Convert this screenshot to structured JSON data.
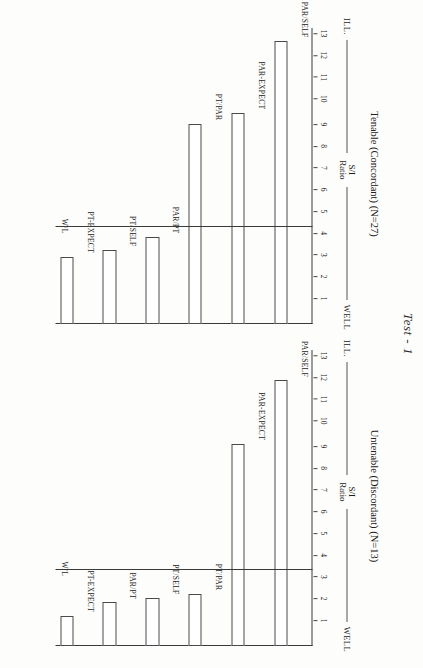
{
  "page": {
    "test_title": "Test - 1"
  },
  "axis": {
    "high_label": "WELL",
    "low_label": "ILL.",
    "name_line1": "S/I",
    "name_line2": "Ratio",
    "ticks": [
      1,
      2,
      3,
      4,
      5,
      6,
      7,
      8,
      9,
      10,
      11,
      12,
      13
    ],
    "wl_label": "W/L"
  },
  "chart_data": [
    {
      "type": "bar",
      "orientation": "horizontal",
      "title": "Tenable (Concordant) (N=27)",
      "xlabel": "S/I Ratio",
      "ylabel": "",
      "xlim": [
        0,
        13.6
      ],
      "grid": false,
      "legend": "none",
      "reference_line": {
        "label": "W/L",
        "value": 4.45
      },
      "axis_end_labels": {
        "low": "ILL.",
        "high": "WELL"
      },
      "categories": [
        "PAR/SELF",
        "PAR-EXPECT",
        "PT/PAR",
        "PAR/PT",
        "PT/SELF",
        "PT-EXPECT"
      ],
      "values": [
        13.0,
        9.7,
        9.2,
        4.0,
        3.4,
        3.1
      ]
    },
    {
      "type": "bar",
      "orientation": "horizontal",
      "title": "Untenable (Discordant) (N=13)",
      "xlabel": "S/I Ratio",
      "ylabel": "",
      "xlim": [
        0,
        13.6
      ],
      "grid": false,
      "legend": "none",
      "reference_line": {
        "label": "W/L",
        "value": 3.5
      },
      "axis_end_labels": {
        "low": "ILL.",
        "high": "WELL"
      },
      "categories": [
        "PAR/SELF",
        "PAR-EXPECT",
        "PT/PAR",
        "PT/SELF",
        "PAR/PT",
        "PT-EXPECT"
      ],
      "values": [
        12.2,
        9.3,
        2.4,
        2.2,
        2.0,
        1.4
      ]
    }
  ]
}
